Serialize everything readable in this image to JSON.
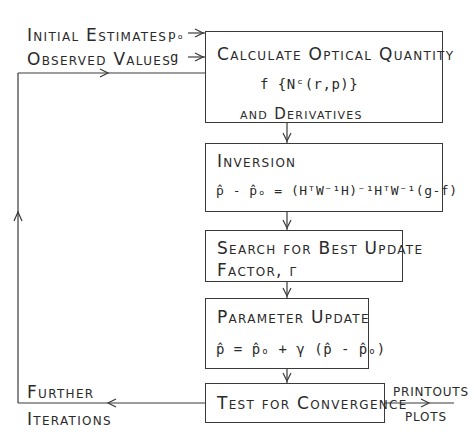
{
  "inputs": {
    "initial_estimates_label": "Initial Estimates",
    "initial_estimates_symbol": "pₒ",
    "observed_values_label": "Observed Values",
    "observed_values_symbol": "g"
  },
  "boxes": {
    "calculate": {
      "title": "Calculate Optical Quantity",
      "formula": "f {Nᶜ(r,p)}",
      "subtitle": "and Derivatives"
    },
    "inversion": {
      "title": "Inversion",
      "formula": "p̂ - p̂ₒ = (HᵀW⁻¹H)⁻¹HᵀW⁻¹(g-f)"
    },
    "search": {
      "title_line1": "Search for Best Update",
      "title_line2": "Factor, γ"
    },
    "update": {
      "title": "Parameter Update",
      "formula": "p̂ = p̂ₒ + γ (p̂ - p̂ₒ)"
    },
    "test": {
      "title": "Test for Convergence"
    }
  },
  "outputs": {
    "printouts": "PRINTOUTS",
    "plots": "PLOTS"
  },
  "loop": {
    "further": "Further",
    "iterations": "Iterations"
  },
  "colors": {
    "line": "#3a3a3a",
    "text": "#2a2a2a",
    "background": "#ffffff"
  }
}
